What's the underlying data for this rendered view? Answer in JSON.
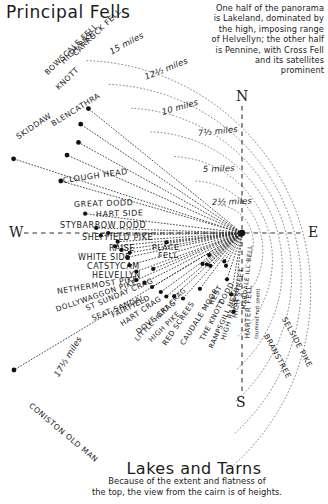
{
  "page": {
    "title": "Principal Fells",
    "footer_title": "Lakes and Tarns"
  },
  "blurb": {
    "lines": [
      "One half of the panorama",
      "is Lakeland, dominated by",
      "the high, imposing range",
      "of Helvellyn; the other half",
      "is Pennine, with Cross Fell",
      "and its satellites",
      "prominent"
    ]
  },
  "footnote": {
    "lines": [
      "Because of the extent and flatness of",
      "the top, the view from the cairn is of heights."
    ]
  },
  "compass": {
    "north": "N",
    "east": "E",
    "south": "S",
    "west": "W"
  },
  "chart_data": {
    "type": "scatter",
    "title": "Principal Fells",
    "subtitle": "Panorama of summits seen from the cairn",
    "center": {
      "x": 242,
      "y": 233,
      "label": "viewpoint cairn"
    },
    "radial_axis": {
      "label": "miles",
      "unit": "miles",
      "rings": [
        {
          "label": "2½ miles",
          "miles": 2.5,
          "radius_px": 38
        },
        {
          "label": "5 miles",
          "miles": 5,
          "radius_px": 70
        },
        {
          "label": "7½ miles",
          "miles": 7.5,
          "radius_px": 103
        },
        {
          "label": "10 miles",
          "miles": 10,
          "radius_px": 136
        },
        {
          "label": "12½ miles",
          "miles": 12.5,
          "radius_px": 168
        },
        {
          "label": "15 miles",
          "miles": 15,
          "radius_px": 200
        },
        {
          "label": "17½ miles",
          "miles": 17.5,
          "radius_px": 232
        }
      ],
      "grid": true,
      "legend_position": "none"
    },
    "angular_axis": {
      "cardinals": [
        "N",
        "E",
        "S",
        "W"
      ],
      "span_description": "half-circle sweep to the west from the viewpoint"
    },
    "points": [
      {
        "name": "CARROCK FELL",
        "miles": 13.0,
        "bearing_deg": 309
      },
      {
        "name": "HIGH PIKE",
        "miles": 12.8,
        "bearing_deg": 304
      },
      {
        "name": "BOWSCALE FELL",
        "miles": 12.3,
        "bearing_deg": 299
      },
      {
        "name": "KNOTT",
        "miles": 12.6,
        "bearing_deg": 294
      },
      {
        "name": "SKIDDAW",
        "miles": 15.8,
        "bearing_deg": 288
      },
      {
        "name": "BLENCATHRA",
        "miles": 12.4,
        "bearing_deg": 286
      },
      {
        "name": "CLOUGH HEAD",
        "miles": 10.4,
        "bearing_deg": 277
      },
      {
        "name": "GREAT DODD",
        "miles": 9.6,
        "bearing_deg": 272
      },
      {
        "name": "HART SIDE",
        "miles": 8.8,
        "bearing_deg": 270
      },
      {
        "name": "STYBARROW DODD",
        "miles": 9.3,
        "bearing_deg": 269
      },
      {
        "name": "SHEFFIELD PIKE",
        "miles": 8.2,
        "bearing_deg": 266
      },
      {
        "name": "RAISE",
        "miles": 8.4,
        "bearing_deg": 264
      },
      {
        "name": "WHITE SIDE",
        "miles": 8.0,
        "bearing_deg": 262
      },
      {
        "name": "CATSTYCAM",
        "miles": 7.5,
        "bearing_deg": 260
      },
      {
        "name": "HELVELLYN",
        "miles": 7.7,
        "bearing_deg": 258
      },
      {
        "name": "PLACE FELL",
        "miles": 5.0,
        "bearing_deg": 263
      },
      {
        "name": "NETHERMOST PIKE",
        "miles": 7.7,
        "bearing_deg": 254
      },
      {
        "name": "DOLLYWAGGON PIKE",
        "miles": 7.4,
        "bearing_deg": 250
      },
      {
        "name": "ST SUNDAY CRAG",
        "miles": 6.3,
        "bearing_deg": 248
      },
      {
        "name": "SEAT SANDAL",
        "miles": 7.6,
        "bearing_deg": 246
      },
      {
        "name": "FAIRFIELD",
        "miles": 7.2,
        "bearing_deg": 243
      },
      {
        "name": "HART CRAG",
        "miles": 6.9,
        "bearing_deg": 239
      },
      {
        "name": "DOVE CRAG",
        "miles": 6.6,
        "bearing_deg": 234
      },
      {
        "name": "HIGH PIKE",
        "miles": 6.5,
        "bearing_deg": 230
      },
      {
        "name": "LITTLE HART CRAG",
        "miles": 6.1,
        "bearing_deg": 227
      },
      {
        "name": "RED SCREES",
        "miles": 5.8,
        "bearing_deg": 222
      },
      {
        "name": "CAUDALE MOOR",
        "miles": 4.6,
        "bearing_deg": 217
      },
      {
        "name": "REST DODD",
        "miles": 3.3,
        "bearing_deg": 232
      },
      {
        "name": "THE KNOTT",
        "miles": 3.0,
        "bearing_deg": 224
      },
      {
        "name": "RAMPSGILL HEAD",
        "miles": 3.1,
        "bearing_deg": 228
      },
      {
        "name": "HIGH RAISE",
        "miles": 2.6,
        "bearing_deg": 236
      },
      {
        "name": "HIGH STREET",
        "miles": 2.2,
        "bearing_deg": 212
      },
      {
        "name": "MARDALE ILL BELL",
        "miles": 2.4,
        "bearing_deg": 206
      },
      {
        "name": "HARTER FELL",
        "miles": 3.2,
        "bearing_deg": 198
      },
      {
        "name": "BRANSTREE",
        "miles": 4.1,
        "bearing_deg": 190
      },
      {
        "name": "SELSIDE PIKE",
        "miles": 5.2,
        "bearing_deg": 186
      },
      {
        "name": "CONISTON OLD MAN",
        "miles": 17.5,
        "bearing_deg": 239
      }
    ],
    "annotations": [
      {
        "text": "(summit not seen)",
        "attached_to": "HARTER FELL"
      }
    ]
  },
  "labels": {
    "fells": [
      {
        "text": "CARROCK FELL",
        "x": 74,
        "y": 50,
        "rot": -44,
        "size": 7.6
      },
      {
        "text": "HIGH PIKE",
        "x": 62,
        "y": 58,
        "rot": -44,
        "size": 7.6
      },
      {
        "text": "BOWSCALE FELL",
        "x": 46,
        "y": 69,
        "rot": -44,
        "size": 7.6
      },
      {
        "text": "KNOTT",
        "x": 57,
        "y": 84,
        "rot": -44,
        "size": 7.6
      },
      {
        "text": "SKIDDAW",
        "x": 17,
        "y": 133,
        "rot": -34,
        "size": 7.8
      },
      {
        "text": "BLENCATHRA",
        "x": 52,
        "y": 120,
        "rot": -32,
        "size": 7.6
      },
      {
        "text": "CLOUGH HEAD",
        "x": 63,
        "y": 176,
        "rot": -8,
        "size": 8.0
      },
      {
        "text": "GREAT DODD",
        "x": 74,
        "y": 200,
        "rot": -2,
        "size": 8.0
      },
      {
        "text": "HART SIDE",
        "x": 96,
        "y": 210,
        "rot": -2,
        "size": 8.0
      },
      {
        "text": "STYBARROW DODD",
        "x": 60,
        "y": 221,
        "rot": 0,
        "size": 8.0
      },
      {
        "text": "SHEFFIELD PIKE",
        "x": 82,
        "y": 233,
        "rot": 0,
        "size": 8.0
      },
      {
        "text": "RAISE",
        "x": 109,
        "y": 244,
        "rot": 0,
        "size": 8.0
      },
      {
        "text": "PLACE",
        "x": 152,
        "y": 243,
        "rot": 0,
        "size": 7.8
      },
      {
        "text": "FELL",
        "x": 158,
        "y": 251,
        "rot": 0,
        "size": 7.8
      },
      {
        "text": "WHITE SIDE",
        "x": 78,
        "y": 253,
        "rot": 0,
        "size": 8.0
      },
      {
        "text": "CATSTYCAM",
        "x": 87,
        "y": 262,
        "rot": 0,
        "size": 8.0
      },
      {
        "text": "HELVELLYN",
        "x": 92,
        "y": 271,
        "rot": 0,
        "size": 8.0
      },
      {
        "text": "NETHERMOST PIKE",
        "x": 57,
        "y": 287,
        "rot": -9,
        "size": 7.8
      },
      {
        "text": "DOLLYWAGGON PIKE",
        "x": 56,
        "y": 305,
        "rot": -19,
        "size": 7.4
      },
      {
        "text": "ST SUNDAY CRAG",
        "x": 86,
        "y": 304,
        "rot": -23,
        "size": 7.4
      },
      {
        "text": "SEAT SANDAL",
        "x": 92,
        "y": 314,
        "rot": -22,
        "size": 7.4
      },
      {
        "text": "FAIRFIELD",
        "x": 112,
        "y": 311,
        "rot": -26,
        "size": 7.4
      },
      {
        "text": "HART CRAG",
        "x": 121,
        "y": 320,
        "rot": -34,
        "size": 7.4
      },
      {
        "text": "DOVE CRAG",
        "x": 137,
        "y": 328,
        "rot": -39,
        "size": 7.4
      },
      {
        "text": "HIGH PIKE",
        "x": 150,
        "y": 337,
        "rot": -44,
        "size": 7.0
      },
      {
        "text": "LITTLE HART CRAG",
        "x": 136,
        "y": 336,
        "rot": -46,
        "size": 6.6
      },
      {
        "text": "RED SCREES",
        "x": 164,
        "y": 340,
        "rot": -56,
        "size": 7.2
      },
      {
        "text": "CAUDALE MOOR",
        "x": 182,
        "y": 340,
        "rot": -58,
        "size": 7.2
      },
      {
        "text": "THE KNOTT",
        "x": 202,
        "y": 336,
        "rot": -62,
        "size": 7.0
      },
      {
        "text": "REST",
        "x": 211,
        "y": 300,
        "rot": -62,
        "size": 7.0
      },
      {
        "text": "DODD",
        "x": 221,
        "y": 300,
        "rot": -62,
        "size": 7.0
      },
      {
        "text": "RAMPSGILL HEAD",
        "x": 211,
        "y": 344,
        "rot": -66,
        "size": 6.7
      },
      {
        "text": "HIGH RAISE",
        "x": 223,
        "y": 336,
        "rot": -72,
        "size": 6.8
      },
      {
        "text": "HIGH STREET",
        "x": 235,
        "y": 314,
        "rot": -82,
        "size": 6.6
      },
      {
        "text": "MARDALE ILL BELL",
        "x": 243,
        "y": 306,
        "rot": -84,
        "size": 6.0
      },
      {
        "text": "HARTER FELL",
        "x": 247,
        "y": 334,
        "rot": -88,
        "size": 7.2
      },
      {
        "text": "BRANSTREE",
        "x": 266,
        "y": 330,
        "rot": 62,
        "size": 7.4
      },
      {
        "text": "SELSIDE PIKE",
        "x": 284,
        "y": 313,
        "rot": 62,
        "size": 7.4
      },
      {
        "text": "CONISTON OLD MAN",
        "x": 30,
        "y": 400,
        "rot": 40,
        "size": 7.6
      }
    ],
    "annotation": {
      "text": "(summit not seen)",
      "x": 256,
      "y": 336,
      "rot": -88
    },
    "rings": [
      {
        "text": "15 miles",
        "x": 110,
        "y": 47,
        "rot": -28
      },
      {
        "text": "12½ miles",
        "x": 145,
        "y": 72,
        "rot": -22
      },
      {
        "text": "10 miles",
        "x": 162,
        "y": 107,
        "rot": -16
      },
      {
        "text": "7½ miles",
        "x": 198,
        "y": 128,
        "rot": -6
      },
      {
        "text": "5 miles",
        "x": 203,
        "y": 164,
        "rot": -2
      },
      {
        "text": "2½ miles",
        "x": 212,
        "y": 197,
        "rot": -2
      },
      {
        "text": "17½ miles",
        "x": 56,
        "y": 371,
        "rot": -59
      }
    ]
  }
}
